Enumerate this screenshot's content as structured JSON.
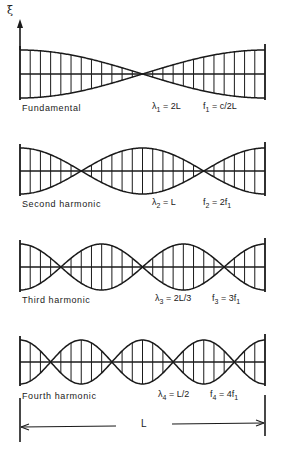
{
  "figure": {
    "axis_label": "ξ",
    "length_label": "L",
    "stroke_color": "#1a1a1a",
    "background": "#ffffff",
    "x_start": 20,
    "x_end": 265,
    "modes": [
      {
        "name": "Fundamental",
        "n": 1,
        "center_y": 74,
        "amplitude": 24,
        "lambda_sub": "1",
        "lambda_val": "2L",
        "f_sub": "1",
        "f_val": "c/2L",
        "label_y": 103
      },
      {
        "name": "Second harmonic",
        "n": 2,
        "center_y": 171,
        "amplitude": 23,
        "lambda_sub": "2",
        "lambda_val": "L",
        "f_sub": "2",
        "f_val": "2f",
        "f_val_sub": "1",
        "label_y": 199
      },
      {
        "name": "Third harmonic",
        "n": 3,
        "center_y": 267,
        "amplitude": 23,
        "lambda_sub": "3",
        "lambda_val": "2L/3",
        "f_sub": "3",
        "f_val": "3f",
        "f_val_sub": "1",
        "label_y": 295
      },
      {
        "name": "Fourth harmonic",
        "n": 4,
        "center_y": 362,
        "amplitude": 22,
        "lambda_sub": "4",
        "lambda_val": "L/2",
        "f_sub": "4",
        "f_val": "4f",
        "f_val_sub": "1",
        "label_y": 391
      }
    ]
  }
}
